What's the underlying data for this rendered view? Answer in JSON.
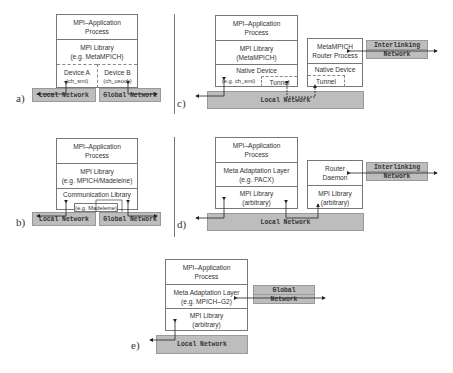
{
  "panels": {
    "a": {
      "label": "a)",
      "stack": {
        "app": [
          "MPI–Application",
          "Process"
        ],
        "lib": [
          "MPI  Library",
          "(e.g. MetaMPICH)"
        ],
        "device_a": [
          "Device A",
          "(ch_smi)"
        ],
        "device_b": [
          "Device B",
          "(ch_usock)"
        ]
      },
      "networks": {
        "local": "Local Network",
        "global": "Global Network"
      }
    },
    "b": {
      "label": "b)",
      "stack": {
        "app": [
          "MPI–Application",
          "Process"
        ],
        "lib": [
          "MPI  Library",
          "(e.g. MPICH/Madeleine)"
        ],
        "comm": "Communication Library",
        "comm_example": "(e.g. Madeleine)"
      },
      "networks": {
        "local": "Local Network",
        "global": "Global Network"
      }
    },
    "c": {
      "label": "c)",
      "stack": {
        "app": [
          "MPI–Application",
          "Process"
        ],
        "lib": [
          "MPI  Library",
          "(MetaMPICH)"
        ],
        "native": "Native Device",
        "native_example": "(e.g. ch_smi)",
        "tunnel": "Tunnel"
      },
      "router": {
        "title": [
          "MetaMPICH",
          "Router Process"
        ],
        "native": "Native Device",
        "tunnel": "Tunnel"
      },
      "networks": {
        "local": "Local Network",
        "interlinking": [
          "Interlinking",
          "Network"
        ]
      }
    },
    "d": {
      "label": "d)",
      "stack": {
        "app": [
          "MPI–Application",
          "Process"
        ],
        "meta": [
          "Meta Adaptation Layer",
          "(e.g. PACX)"
        ],
        "lib": [
          "MPI  Library",
          "(arbitrary)"
        ]
      },
      "router": {
        "title": [
          "Router",
          "Daemon"
        ],
        "lib": [
          "MPI  Library",
          "(arbitrary)"
        ]
      },
      "networks": {
        "local": "Local Network",
        "interlinking": [
          "Interlinking",
          "Network"
        ]
      }
    },
    "e": {
      "label": "e)",
      "stack": {
        "app": [
          "MPI–Application",
          "Process"
        ],
        "meta": [
          "Meta Adaptation Layer",
          "(e.g. MPICH–G2)"
        ],
        "lib": [
          "MPI  Library",
          "(arbitrary)"
        ]
      },
      "networks": {
        "local": "Local Network",
        "global": [
          "Global",
          "Network"
        ]
      }
    }
  },
  "colors": {
    "network_fill": "#bdbdbd",
    "border": "#777777",
    "text": "#333333"
  }
}
